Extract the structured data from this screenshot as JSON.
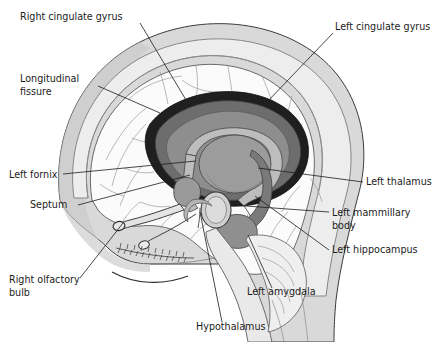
{
  "figure": {
    "kind": "anatomical-illustration",
    "view": "sagittal-cutaway",
    "background_color": "#ffffff",
    "line_color": "#1c1c1c"
  },
  "palette": {
    "background": "#ffffff",
    "scalp": "#d9d9d9",
    "skull_outer": "#c4c4c4",
    "skull_inner": "#ededed",
    "cortex": "#fbfbfb",
    "sulcus_line": "#9b9b9b",
    "corpus_callosum_dark": "#1f1f1f",
    "cingulate_gyrus": "#6d6d6d",
    "fornix": "#a8a8a8",
    "thalamus": "#9c9c9c",
    "hippocampus": "#7a7a7a",
    "amygdala": "#8f8f8f",
    "mammillary_body": "#cfcfcf",
    "brainstem": "#e3e3e3",
    "cerebellum": "#efefef",
    "face": "#f2f2f2"
  },
  "labels": [
    {
      "id": "right-cingulate-gyrus",
      "text": "Right cingulate gyrus",
      "anchor": "start",
      "x": 20,
      "y": 20,
      "leader": "M 140,23 L 186,100"
    },
    {
      "id": "longitudinal-fissure",
      "text_lines": [
        "Longitudinal",
        "fissure"
      ],
      "anchor": "start",
      "x": 20,
      "y": 82,
      "leader": "M 98,86 L 160,113"
    },
    {
      "id": "left-cingulate-gyrus",
      "text": "Left cingulate gyrus",
      "anchor": "start",
      "x": 335,
      "y": 30,
      "leader": "M 333,33 L 268,101"
    },
    {
      "id": "left-fornix",
      "text": "Left fornix",
      "anchor": "start",
      "x": 9,
      "y": 178,
      "leader": "M 63,174 L 196,161"
    },
    {
      "id": "septum",
      "text": "Septum",
      "anchor": "start",
      "x": 30,
      "y": 208,
      "leader": "M 78,205 L 190,175"
    },
    {
      "id": "right-olfactory-bulb",
      "text_lines": [
        "Right olfactory",
        "bulb"
      ],
      "anchor": "start",
      "x": 9,
      "y": 283,
      "leader": "M 80,278 L 123,223"
    },
    {
      "id": "left-thalamus",
      "text": "Left thalamus",
      "anchor": "start",
      "x": 366,
      "y": 185,
      "leader": "M 363,182 L 258,168"
    },
    {
      "id": "left-mammillary-body",
      "text_lines": [
        "Left mammillary",
        "body"
      ],
      "anchor": "start",
      "x": 332,
      "y": 216,
      "leader": "M 329,212 L 232,205"
    },
    {
      "id": "left-hippocampus",
      "text": "Left hippocampus",
      "anchor": "start",
      "x": 332,
      "y": 253,
      "leader": "M 329,250 L 255,196"
    },
    {
      "id": "left-amygdala",
      "text": "Left amygdala",
      "anchor": "start",
      "x": 247,
      "y": 295,
      "leader": "M 272,288 L 248,235"
    },
    {
      "id": "hypothalamus",
      "text": "Hypothalamus",
      "anchor": "start",
      "x": 196,
      "y": 330,
      "leader": "M 222,322 L 200,212"
    }
  ]
}
